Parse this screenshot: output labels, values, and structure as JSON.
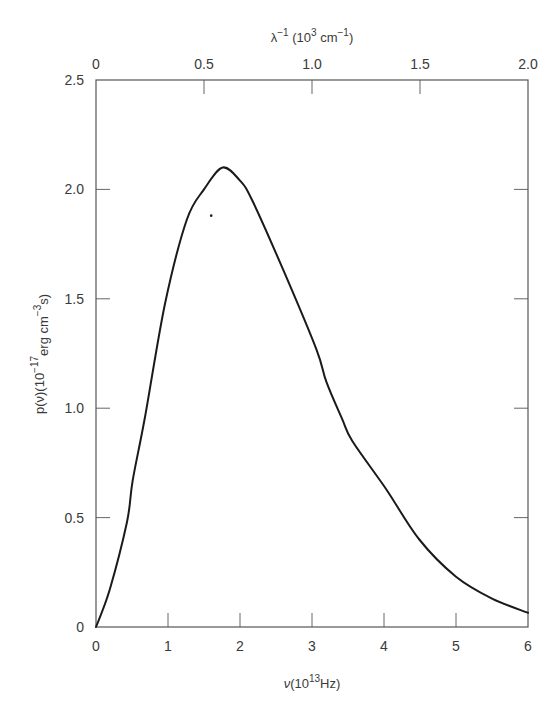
{
  "chart_data": {
    "type": "line",
    "title": "",
    "xlabel": "ν(10^13 Hz)",
    "xlabel_parts": {
      "sym": "ν",
      "open": "(10",
      "sup": "13",
      "unit": "Hz)"
    },
    "ylabel": "p(ν)(10^-17 erg cm^-3 s)",
    "ylabel_parts": {
      "pre": "p(ν)(10",
      "sup": "−17",
      "sub": "erg cm",
      "subsup": "−3",
      "tail": "s)"
    },
    "x2label": "λ^-1 (10^3 cm^-1)",
    "x2label_parts": {
      "sym": "λ",
      "sup": "−1",
      "open": " (10",
      "sup2": "3",
      "unit": " cm",
      "sup3": "−1",
      "close": ")"
    },
    "xlim": [
      0,
      6
    ],
    "ylim": [
      0,
      2.5
    ],
    "x2lim": [
      0,
      2.0
    ],
    "xticks": [
      "0",
      "1",
      "2",
      "3",
      "4",
      "5",
      "6"
    ],
    "yticks": [
      "0",
      "0.5",
      "1.0",
      "1.5",
      "2.0",
      "2.5"
    ],
    "x2ticks": [
      "0",
      "0.5",
      "1.0",
      "1.5",
      "2.0"
    ],
    "grid": false,
    "legend": null,
    "series": [
      {
        "name": "p(ν)",
        "x": [
          0,
          0.19,
          0.43,
          0.51,
          0.68,
          0.96,
          1.26,
          1.5,
          1.76,
          2.0,
          2.17,
          2.59,
          3.06,
          3.2,
          3.42,
          3.56,
          4.03,
          4.49,
          5.0,
          5.5,
          6.0
        ],
        "values": [
          0,
          0.17,
          0.48,
          0.67,
          0.96,
          1.48,
          1.86,
          2.0,
          2.1,
          2.04,
          1.95,
          1.64,
          1.27,
          1.12,
          0.95,
          0.85,
          0.63,
          0.4,
          0.23,
          0.13,
          0.065
        ]
      }
    ],
    "annotations": [
      {
        "type": "stray-dot",
        "x": 1.6,
        "y": 1.88
      }
    ],
    "peak": {
      "x": 1.76,
      "y": 2.1
    }
  },
  "colors": {
    "curve": "#1a1a1a",
    "frame": "#555555",
    "text": "#3a3a3a",
    "background": "#ffffff"
  }
}
